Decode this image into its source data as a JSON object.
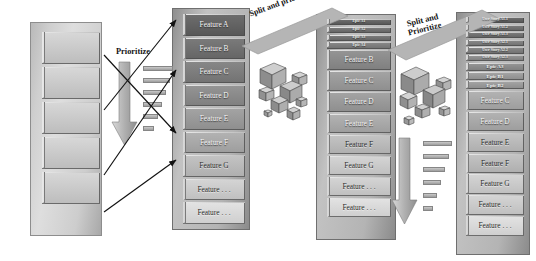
{
  "diagram": {
    "colors": {
      "block_dark": "#6d6d6d",
      "block_light": "#e2e2e2",
      "stack_side": "#a9a9a9",
      "arrow_black": "#111111",
      "background": "#ffffff"
    }
  },
  "transitions": [
    {
      "id": "prioritize",
      "label": "Prioritize"
    },
    {
      "id": "split-prioritize-1",
      "label": "Split and prioritize"
    },
    {
      "id": "split-prioritize-2",
      "label": "Split and\nPrioritize"
    }
  ],
  "stacks": [
    {
      "id": "stack-1",
      "name": "unrefined-backlog",
      "items": [
        {
          "label": "",
          "size": "blank"
        },
        {
          "label": "",
          "size": "blank"
        },
        {
          "label": "",
          "size": "blank"
        },
        {
          "label": "",
          "size": "blank"
        },
        {
          "label": "",
          "size": "blank"
        }
      ]
    },
    {
      "id": "stack-2",
      "name": "feature-backlog",
      "items": [
        {
          "label": "Feature A",
          "size": "med"
        },
        {
          "label": "Feature B",
          "size": "med"
        },
        {
          "label": "Feature C",
          "size": "med"
        },
        {
          "label": "Feature D",
          "size": "med"
        },
        {
          "label": "Feature E",
          "size": "med"
        },
        {
          "label": "Feature F",
          "size": "med"
        },
        {
          "label": "Feature G",
          "size": "med"
        },
        {
          "label": "Feature . . .",
          "size": "med"
        },
        {
          "label": "Feature . . .",
          "size": "med"
        }
      ]
    },
    {
      "id": "stack-3",
      "name": "epic-split-backlog",
      "items": [
        {
          "label": "Epic A1",
          "size": "tiny"
        },
        {
          "label": "Epic A2",
          "size": "tiny"
        },
        {
          "label": "Epic A3",
          "size": "tiny"
        },
        {
          "label": "Epic A4",
          "size": "tiny"
        },
        {
          "label": "Feature B",
          "size": "med"
        },
        {
          "label": "Feature C",
          "size": "med"
        },
        {
          "label": "Feature D",
          "size": "med"
        },
        {
          "label": "Feature E",
          "size": "med"
        },
        {
          "label": "Feature F",
          "size": "med"
        },
        {
          "label": "Feature G",
          "size": "med"
        },
        {
          "label": "Feature . . .",
          "size": "med"
        },
        {
          "label": "Feature . . .",
          "size": "med"
        }
      ]
    },
    {
      "id": "stack-4",
      "name": "user-story-split-backlog",
      "items": [
        {
          "label": "User Story A1.1",
          "size": "tiny"
        },
        {
          "label": "User Story A1.2",
          "size": "tiny"
        },
        {
          "label": "User Story A1.3",
          "size": "tiny"
        },
        {
          "label": "User Story A2.1",
          "size": "tiny"
        },
        {
          "label": "User Story A2.2",
          "size": "tiny"
        },
        {
          "label": "User Story A2.3",
          "size": "tiny"
        },
        {
          "label": "Epic A3",
          "size": "small"
        },
        {
          "label": "Epic B1",
          "size": "small"
        },
        {
          "label": "Epic B2",
          "size": "small"
        },
        {
          "label": "Feature C",
          "size": "med"
        },
        {
          "label": "Feature D",
          "size": "med"
        },
        {
          "label": "Feature E",
          "size": "med"
        },
        {
          "label": "Feature F",
          "size": "med"
        },
        {
          "label": "Feature G",
          "size": "med"
        },
        {
          "label": "Feature . . .",
          "size": "med"
        },
        {
          "label": "Feature . . .",
          "size": "med"
        }
      ]
    }
  ]
}
